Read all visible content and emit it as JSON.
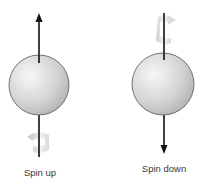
{
  "diagram": {
    "panels": [
      {
        "id": "spin-up",
        "label": "Spin up",
        "arrow_direction": "up",
        "rotation_marker_position": "bottom"
      },
      {
        "id": "spin-down",
        "label": "Spin down",
        "arrow_direction": "down",
        "rotation_marker_position": "top"
      }
    ],
    "colors": {
      "sphere_fill_light": "#f4f4f4",
      "sphere_fill_dark": "#b8b8b8",
      "sphere_stroke": "#555555",
      "arrow": "#111111",
      "rotation_marker": "#d6d6d6"
    }
  }
}
